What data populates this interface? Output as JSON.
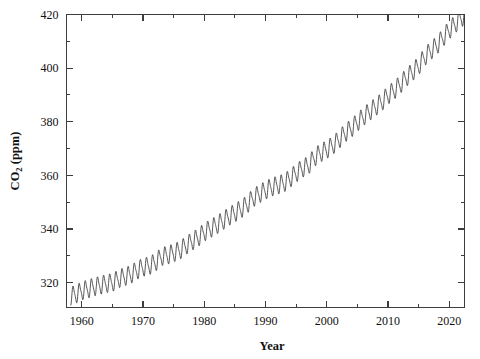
{
  "chart_data": {
    "type": "line",
    "title": "",
    "subtitle": "",
    "xlabel": "Year",
    "ylabel": "CO2 (ppm)",
    "ylabel_base": "CO",
    "ylabel_subscript": "2",
    "ylabel_unit": " (ppm)",
    "xlim": [
      1957.5,
      2022.5
    ],
    "ylim": [
      310.7,
      420.0
    ],
    "grid": false,
    "legend": null,
    "legend_position": "none",
    "line_color": "#3a3a3a",
    "axis_color": "#3d3d3d",
    "background_color": "#ffffff",
    "x_ticks_major": [
      1960,
      1970,
      1980,
      1990,
      2000,
      2010,
      2020
    ],
    "x_tick_labels": [
      "1960",
      "1970",
      "1980",
      "1990",
      "2000",
      "2010",
      "2020"
    ],
    "x_ticks_minor": [
      1965,
      1975,
      1985,
      1995,
      2005,
      2015
    ],
    "y_ticks_major": [
      320,
      340,
      360,
      380,
      400,
      420
    ],
    "y_tick_labels": [
      "320",
      "340",
      "360",
      "380",
      "400",
      "420"
    ],
    "y_ticks_minor": [
      330,
      350,
      370,
      390,
      410
    ],
    "series_name": "Atmospheric CO2 concentration",
    "seasonal_amplitude_ppm": 3.1,
    "x": [
      1958.2,
      1959.0,
      1960.0,
      1961.0,
      1962.0,
      1963.0,
      1964.0,
      1965.0,
      1966.0,
      1967.0,
      1968.0,
      1969.0,
      1970.0,
      1971.0,
      1972.0,
      1973.0,
      1974.0,
      1975.0,
      1976.0,
      1977.0,
      1978.0,
      1979.0,
      1980.0,
      1981.0,
      1982.0,
      1983.0,
      1984.0,
      1985.0,
      1986.0,
      1987.0,
      1988.0,
      1989.0,
      1990.0,
      1991.0,
      1992.0,
      1993.0,
      1994.0,
      1995.0,
      1996.0,
      1997.0,
      1998.0,
      1999.0,
      2000.0,
      2001.0,
      2002.0,
      2003.0,
      2004.0,
      2005.0,
      2006.0,
      2007.0,
      2008.0,
      2009.0,
      2010.0,
      2011.0,
      2012.0,
      2013.0,
      2014.0,
      2015.0,
      2016.0,
      2017.0,
      2018.0,
      2019.0,
      2020.0,
      2021.0,
      2022.0
    ],
    "y_annual_mean": [
      315.0,
      315.6,
      316.9,
      317.6,
      318.4,
      319.0,
      319.6,
      320.0,
      321.4,
      322.2,
      323.0,
      324.6,
      325.7,
      326.3,
      327.5,
      329.7,
      330.2,
      331.1,
      332.0,
      333.8,
      335.4,
      336.8,
      338.8,
      340.1,
      341.4,
      343.0,
      344.6,
      346.0,
      347.4,
      349.2,
      351.6,
      353.1,
      354.4,
      355.6,
      356.4,
      357.1,
      358.8,
      360.8,
      362.6,
      363.7,
      366.7,
      368.4,
      369.6,
      371.2,
      373.3,
      375.8,
      377.5,
      379.8,
      381.9,
      383.8,
      385.6,
      387.4,
      389.9,
      391.7,
      393.9,
      396.5,
      398.6,
      400.8,
      404.2,
      406.5,
      408.5,
      411.4,
      414.2,
      416.4,
      419.0
    ]
  },
  "figure": {
    "width": 480,
    "height": 359
  }
}
